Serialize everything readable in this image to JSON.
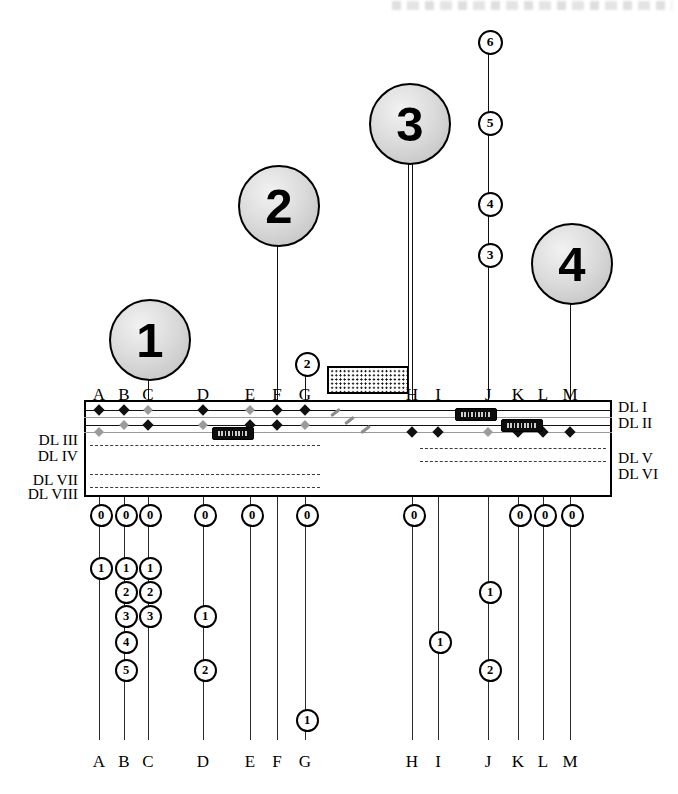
{
  "diagram": {
    "title_artifact": "",
    "balloons": [
      {
        "label": "1",
        "x": 148,
        "y": 338,
        "r": 39,
        "stem_to": 400
      },
      {
        "label": "2",
        "x": 277,
        "y": 204,
        "r": 39,
        "stem_to": 400
      },
      {
        "label": "3",
        "x": 408,
        "y": 122,
        "r": 39,
        "stem_to": 400
      },
      {
        "label": "4",
        "x": 570,
        "y": 262,
        "r": 39,
        "stem_to": 400
      }
    ],
    "columns": [
      {
        "id": "A",
        "label": "A",
        "x": 99,
        "top_y": 404,
        "above": [],
        "below": [
          "0",
          "1"
        ]
      },
      {
        "id": "B",
        "label": "B",
        "x": 124,
        "top_y": 404,
        "above": [],
        "below": [
          "0",
          "1",
          "2",
          "3",
          "4",
          "5"
        ]
      },
      {
        "id": "C",
        "label": "C",
        "x": 148,
        "top_y": 338,
        "above": [],
        "below": [
          "0",
          "1",
          "2",
          "3"
        ]
      },
      {
        "id": "D",
        "label": "D",
        "x": 203,
        "top_y": 404,
        "above": [],
        "below": [
          "0",
          "1",
          "2"
        ]
      },
      {
        "id": "E",
        "label": "E",
        "x": 250,
        "top_y": 404,
        "above": [],
        "below": [
          "0"
        ]
      },
      {
        "id": "F",
        "label": "F",
        "x": 277,
        "top_y": 204,
        "above": [],
        "below": [
          "0"
        ]
      },
      {
        "id": "G",
        "label": "G",
        "x": 305,
        "top_y": 362,
        "above": [
          "2"
        ],
        "below": [
          "0",
          "1"
        ]
      },
      {
        "id": "H",
        "label": "H",
        "x": 412,
        "top_y": 122,
        "above": [],
        "below": [
          "0"
        ]
      },
      {
        "id": "I",
        "label": "I",
        "x": 438,
        "top_y": 404,
        "above": [],
        "below": [
          "1"
        ]
      },
      {
        "id": "J",
        "label": "J",
        "x": 488,
        "top_y": 40,
        "above": [
          "6",
          "5",
          "4",
          "3"
        ],
        "below": [
          "1",
          "2"
        ]
      },
      {
        "id": "K",
        "label": "K",
        "x": 518,
        "top_y": 404,
        "above": [],
        "below": [
          "0"
        ]
      },
      {
        "id": "L",
        "label": "L",
        "x": 543,
        "top_y": 404,
        "above": [],
        "below": [
          "0"
        ]
      },
      {
        "id": "M",
        "label": "M",
        "x": 570,
        "top_y": 262,
        "above": [],
        "below": [
          "0"
        ]
      }
    ],
    "above_chip_positions": {
      "J": [
        40,
        121,
        202,
        253
      ],
      "G": [
        362
      ]
    },
    "below_chip_rows": {
      "zero_y": 513,
      "rows_y": [
        566,
        590,
        614,
        640,
        668,
        718
      ]
    },
    "below_chips": [
      {
        "col": "A",
        "chips": [
          {
            "label": "0",
            "y": 513
          },
          {
            "label": "1",
            "y": 566
          }
        ]
      },
      {
        "col": "B",
        "chips": [
          {
            "label": "0",
            "y": 513
          },
          {
            "label": "1",
            "y": 566
          },
          {
            "label": "2",
            "y": 590
          },
          {
            "label": "3",
            "y": 614
          },
          {
            "label": "4",
            "y": 640
          },
          {
            "label": "5",
            "y": 668
          }
        ]
      },
      {
        "col": "C",
        "chips": [
          {
            "label": "0",
            "y": 513
          },
          {
            "label": "1",
            "y": 566
          },
          {
            "label": "2",
            "y": 590
          },
          {
            "label": "3",
            "y": 614
          }
        ]
      },
      {
        "col": "D",
        "chips": [
          {
            "label": "0",
            "y": 513
          },
          {
            "label": "1",
            "y": 614
          },
          {
            "label": "2",
            "y": 668
          }
        ]
      },
      {
        "col": "E",
        "chips": [
          {
            "label": "0",
            "y": 513
          }
        ]
      },
      {
        "col": "G",
        "chips": [
          {
            "label": "0",
            "y": 513
          },
          {
            "label": "1",
            "y": 718
          }
        ]
      },
      {
        "col": "H",
        "chips": [
          {
            "label": "0",
            "y": 513
          }
        ]
      },
      {
        "col": "I",
        "chips": [
          {
            "label": "1",
            "y": 640
          }
        ]
      },
      {
        "col": "J",
        "chips": [
          {
            "label": "1",
            "y": 590
          },
          {
            "label": "2",
            "y": 668
          }
        ]
      },
      {
        "col": "K",
        "chips": [
          {
            "label": "0",
            "y": 513
          }
        ]
      },
      {
        "col": "L",
        "chips": [
          {
            "label": "0",
            "y": 513
          }
        ]
      },
      {
        "col": "M",
        "chips": [
          {
            "label": "0",
            "y": 513
          }
        ]
      }
    ],
    "cable_box": {
      "x": 84,
      "y": 400,
      "w": 528,
      "h": 97
    },
    "dl_labels_right": [
      {
        "label": "DL I",
        "y": 398
      },
      {
        "label": "DL II",
        "y": 414
      },
      {
        "label": "DL V",
        "y": 449
      },
      {
        "label": "DL VI",
        "y": 465
      }
    ],
    "dl_labels_left": [
      {
        "label": "DL III",
        "y": 431
      },
      {
        "label": "DL IV",
        "y": 447
      },
      {
        "label": "DL VII",
        "y": 471
      },
      {
        "label": "DL VIII",
        "y": 485
      }
    ],
    "solid_lines": [
      {
        "y": 410,
        "x1": 84,
        "x2": 612,
        "weight": "bold"
      },
      {
        "y": 417,
        "x1": 84,
        "x2": 612,
        "weight": "light"
      },
      {
        "y": 425,
        "x1": 84,
        "x2": 612,
        "weight": "bold"
      },
      {
        "y": 432,
        "x1": 84,
        "x2": 612,
        "weight": "light"
      }
    ],
    "dashed_lines": [
      {
        "y": 445,
        "x1": 90,
        "x2": 320
      },
      {
        "y": 448,
        "x1": 420,
        "x2": 606
      },
      {
        "y": 461,
        "x1": 420,
        "x2": 606
      },
      {
        "y": 474,
        "x1": 90,
        "x2": 320
      },
      {
        "y": 487,
        "x1": 90,
        "x2": 320
      }
    ],
    "tags": [
      {
        "x": 212,
        "y": 427,
        "w": 40,
        "h": 11
      },
      {
        "x": 455,
        "y": 408,
        "w": 40,
        "h": 11
      },
      {
        "x": 501,
        "y": 419,
        "w": 40,
        "h": 11
      }
    ],
    "hatch_block": {
      "x": 327,
      "y": 366,
      "w": 78,
      "h": 24
    },
    "break_slashes": [
      {
        "x": 330,
        "y": 411
      },
      {
        "x": 344,
        "y": 419
      },
      {
        "x": 360,
        "y": 428
      }
    ],
    "nodes_dark": [
      {
        "x": 99,
        "y": 410
      },
      {
        "x": 124,
        "y": 410
      },
      {
        "x": 203,
        "y": 410
      },
      {
        "x": 277,
        "y": 410
      },
      {
        "x": 305,
        "y": 410
      },
      {
        "x": 148,
        "y": 425
      },
      {
        "x": 250,
        "y": 425
      },
      {
        "x": 277,
        "y": 425
      },
      {
        "x": 412,
        "y": 432
      },
      {
        "x": 438,
        "y": 432
      },
      {
        "x": 518,
        "y": 432
      },
      {
        "x": 543,
        "y": 432
      },
      {
        "x": 570,
        "y": 432
      }
    ],
    "nodes_gray": [
      {
        "x": 148,
        "y": 410
      },
      {
        "x": 250,
        "y": 410
      },
      {
        "x": 124,
        "y": 425
      },
      {
        "x": 203,
        "y": 425
      },
      {
        "x": 305,
        "y": 425
      },
      {
        "x": 99,
        "y": 432
      },
      {
        "x": 488,
        "y": 432
      }
    ],
    "bottom_letters_y": 752,
    "top_letters_y": 385
  }
}
